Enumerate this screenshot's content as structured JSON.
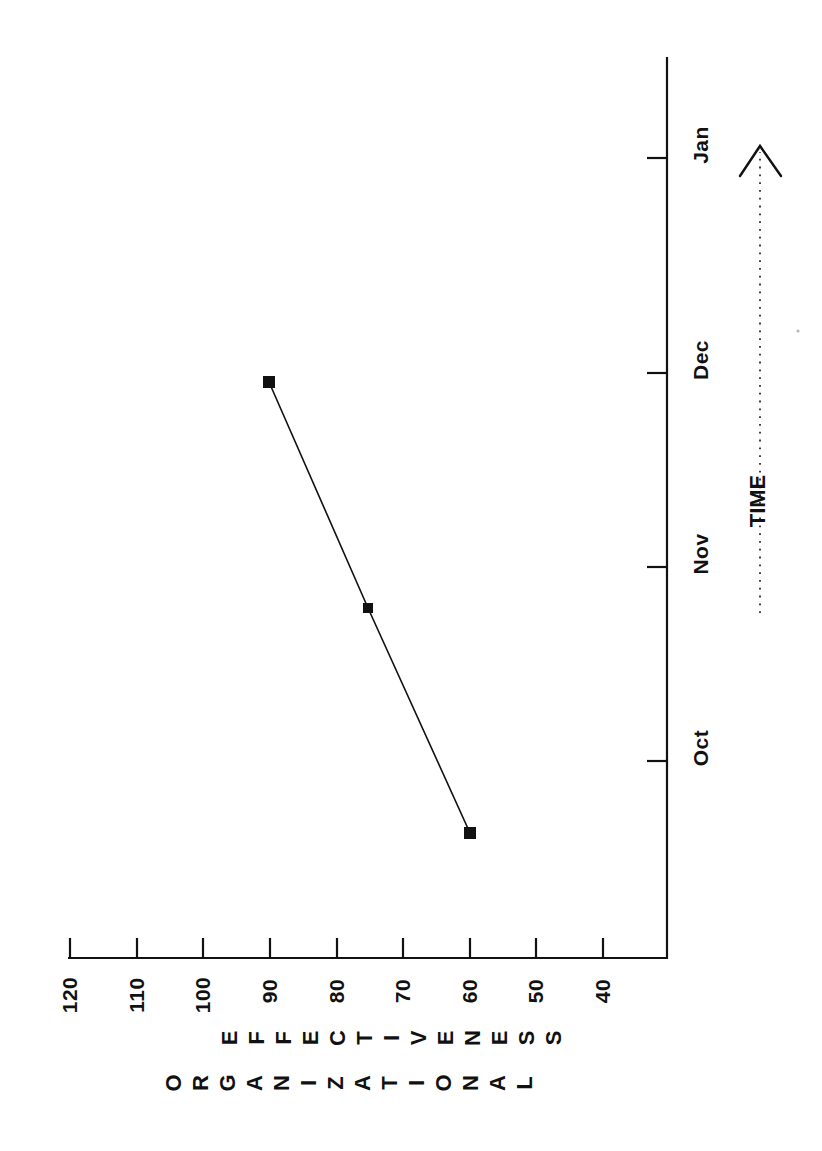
{
  "figure": {
    "orientation": "rotated-90-ccw",
    "background": "#ffffff",
    "ink_color": "#111111"
  },
  "axis_title": {
    "line1": "ORGANIZATIONAL",
    "line2": "EFFECTIVENESS"
  },
  "time_axis": {
    "label": "TIME",
    "arrow_style": "dotted-with-open-arrowhead",
    "direction": "toward-Jan"
  },
  "value_ticks": [
    "120",
    "110",
    "100",
    "90",
    "80",
    "70",
    "60",
    "50",
    "40"
  ],
  "month_ticks": [
    "Jan",
    "Dec",
    "Nov",
    "Oct"
  ],
  "chart_data": {
    "type": "line",
    "title": "",
    "xlabel": "TIME",
    "ylabel": "ORGANIZATIONAL EFFECTIVENESS",
    "categories": [
      "Oct",
      "Nov",
      "Dec"
    ],
    "values": [
      60,
      75,
      90
    ],
    "x_tick_labels": [
      "Oct",
      "Nov",
      "Dec",
      "Jan"
    ],
    "y_tick_labels": [
      40,
      50,
      60,
      70,
      80,
      90,
      100,
      110,
      120
    ],
    "ylim": [
      40,
      120
    ],
    "grid": false,
    "legend": null,
    "marker": "filled-square",
    "line_style": "solid",
    "line_color": "#111111",
    "annotations": [
      "TIME"
    ]
  }
}
